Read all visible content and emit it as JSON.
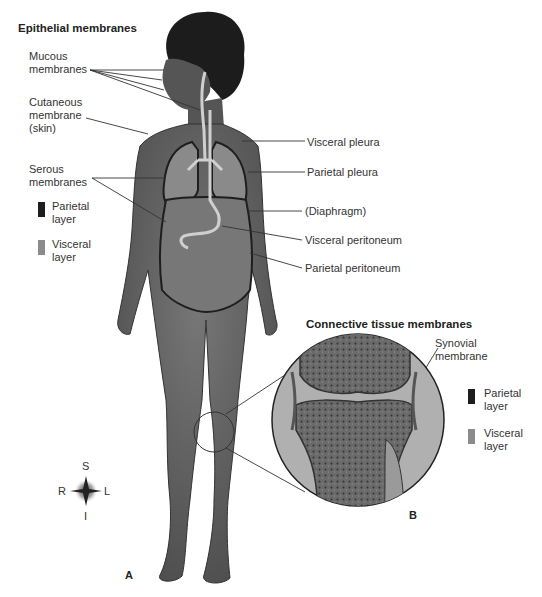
{
  "epithelial": {
    "title": "Epithelial membranes",
    "mucous": [
      "Mucous",
      "membranes"
    ],
    "cutaneous": [
      "Cutaneous",
      "membrane",
      "(skin)"
    ],
    "serous": [
      "Serous",
      "membranes"
    ],
    "legend": [
      {
        "color": "#1e1e1e",
        "lines": [
          "Parietal",
          "layer"
        ]
      },
      {
        "color": "#8c8c8c",
        "lines": [
          "Visceral",
          "layer"
        ]
      }
    ]
  },
  "right_labels": [
    "Visceral pleura",
    "Parietal pleura",
    "(Diaphragm)",
    "Visceral peritoneum",
    "Parietal peritoneum"
  ],
  "connective": {
    "title": "Connective tissue membranes",
    "synovial": [
      "Synovial",
      "membrane"
    ],
    "legend": [
      {
        "color": "#1e1e1e",
        "lines": [
          "Parietal",
          "layer"
        ]
      },
      {
        "color": "#8c8c8c",
        "lines": [
          "Visceral",
          "layer"
        ]
      }
    ]
  },
  "compass": {
    "top": "S",
    "bottom": "I",
    "left": "R",
    "right": "L"
  },
  "panels": {
    "a": "A",
    "b": "B"
  }
}
